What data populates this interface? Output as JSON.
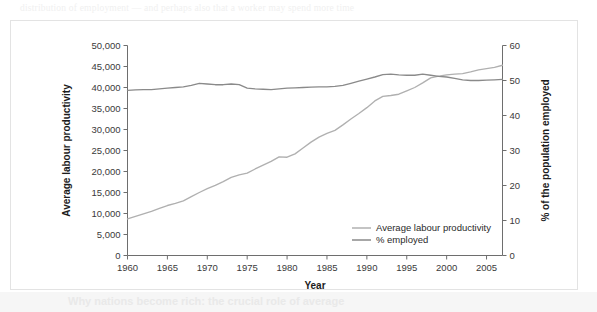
{
  "figure": {
    "background_text_top": "distribution of employment — and perhaps also that a worker may spend more time",
    "background_heading_bottom": "Why nations become rich: the crucial role of average"
  },
  "chart_data": {
    "type": "line",
    "title": "",
    "xlabel": "Year",
    "ylabel": "Average labour productivity",
    "ylabel_right": "% of the population employed",
    "xlim": [
      1960,
      2007
    ],
    "ylim": [
      0,
      50000
    ],
    "ylim_right": [
      0,
      60
    ],
    "xticks": [
      1960,
      1965,
      1970,
      1975,
      1980,
      1985,
      1990,
      1995,
      2000,
      2005
    ],
    "xticklabels": [
      "1960",
      "1965",
      "1970",
      "1975",
      "1980",
      "1985",
      "1990",
      "1995",
      "2000",
      "2005"
    ],
    "yticks": [
      0,
      5000,
      10000,
      15000,
      20000,
      25000,
      30000,
      35000,
      40000,
      45000,
      50000
    ],
    "yticklabels": [
      "0",
      "5,000",
      "10,000",
      "15,000",
      "20,000",
      "25,000",
      "30,000",
      "35,000",
      "40,000",
      "45,000",
      "50,000"
    ],
    "yticks_right": [
      0,
      10,
      20,
      30,
      40,
      50,
      60
    ],
    "yticklabels_right": [
      "0",
      "10",
      "20",
      "30",
      "40",
      "50",
      "60"
    ],
    "grid": false,
    "legend_position": "lower right",
    "series": [
      {
        "name": "Average labour productivity",
        "axis": "left",
        "color": "#b0b0b0",
        "x": [
          1960,
          1961,
          1962,
          1963,
          1964,
          1965,
          1966,
          1967,
          1968,
          1969,
          1970,
          1971,
          1972,
          1973,
          1974,
          1975,
          1976,
          1977,
          1978,
          1979,
          1980,
          1981,
          1982,
          1983,
          1984,
          1985,
          1986,
          1987,
          1988,
          1989,
          1990,
          1991,
          1992,
          1993,
          1994,
          1995,
          1996,
          1997,
          1998,
          1999,
          2000,
          2001,
          2002,
          2003,
          2004,
          2005,
          2006,
          2007
        ],
        "values": [
          8700,
          9300,
          9900,
          10500,
          11200,
          11900,
          12400,
          13000,
          14000,
          15000,
          15900,
          16700,
          17600,
          18600,
          19200,
          19600,
          20600,
          21500,
          22400,
          23500,
          23400,
          24200,
          25600,
          27000,
          28200,
          29100,
          29800,
          31100,
          32500,
          33800,
          35200,
          36800,
          37900,
          38100,
          38400,
          39200,
          40000,
          41100,
          42300,
          42700,
          43000,
          43200,
          43300,
          43700,
          44200,
          44500,
          44800,
          45300
        ]
      },
      {
        "name": "% employed",
        "axis": "right",
        "color": "#8a8a8a",
        "x": [
          1960,
          1961,
          1962,
          1963,
          1964,
          1965,
          1966,
          1967,
          1968,
          1969,
          1970,
          1971,
          1972,
          1973,
          1974,
          1975,
          1976,
          1977,
          1978,
          1979,
          1980,
          1981,
          1982,
          1983,
          1984,
          1985,
          1986,
          1987,
          1988,
          1989,
          1990,
          1991,
          1992,
          1993,
          1994,
          1995,
          1996,
          1997,
          1998,
          1999,
          2000,
          2001,
          2002,
          2003,
          2004,
          2005,
          2006,
          2007
        ],
        "values": [
          47.2,
          47.3,
          47.4,
          47.4,
          47.6,
          47.8,
          48.0,
          48.2,
          48.6,
          49.2,
          49.0,
          48.8,
          48.8,
          49.0,
          48.8,
          47.8,
          47.6,
          47.5,
          47.4,
          47.6,
          47.8,
          47.9,
          48.0,
          48.1,
          48.2,
          48.2,
          48.3,
          48.6,
          49.2,
          49.8,
          50.4,
          51.0,
          51.7,
          51.8,
          51.6,
          51.5,
          51.5,
          51.8,
          51.5,
          51.2,
          51.0,
          50.6,
          50.2,
          50.0,
          50.0,
          50.1,
          50.2,
          50.3
        ]
      }
    ],
    "legend": [
      {
        "label": "Average labour productivity",
        "color": "#b0b0b0"
      },
      {
        "label": "% employed",
        "color": "#8a8a8a"
      }
    ]
  }
}
